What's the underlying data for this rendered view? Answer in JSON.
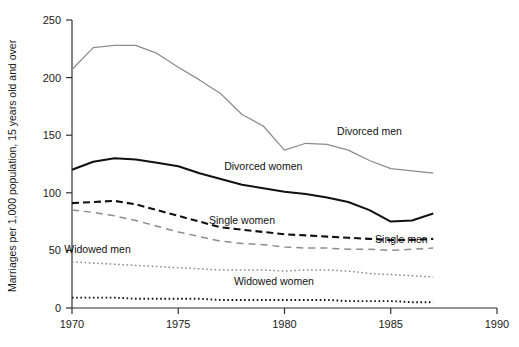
{
  "chart_data": {
    "type": "line",
    "title": "",
    "xlabel": "",
    "ylabel": "Marriages per 1,000 population, 15 years old and over",
    "xlim": [
      1970,
      1990
    ],
    "ylim": [
      0,
      250
    ],
    "xticks": [
      "1970",
      "1975",
      "1980",
      "1985",
      "1990"
    ],
    "yticks": [
      "0",
      "50",
      "100",
      "150",
      "200",
      "250"
    ],
    "grid": false,
    "legend_position": "inline-annotations",
    "x": [
      1970,
      1971,
      1972,
      1973,
      1974,
      1975,
      1976,
      1977,
      1978,
      1979,
      1980,
      1981,
      1982,
      1983,
      1984,
      1985,
      1986,
      1987
    ],
    "series": [
      {
        "name": "Divorced men",
        "color": "#8c8c8c",
        "style": "solid",
        "label_x": 1984,
        "label_y": 150,
        "values": [
          207,
          226,
          228,
          228,
          221,
          209,
          198,
          186,
          168,
          158,
          137,
          143,
          142,
          137,
          128,
          121,
          119,
          117
        ]
      },
      {
        "name": "Divorced women",
        "color": "#111111",
        "style": "solid",
        "label_x": 1979,
        "label_y": 120,
        "values": [
          120,
          127,
          130,
          129,
          126,
          123,
          117,
          112,
          107,
          104,
          101,
          99,
          96,
          92,
          85,
          75,
          76,
          82
        ]
      },
      {
        "name": "Single women",
        "color": "#111111",
        "style": "dashed",
        "label_x": 1978,
        "label_y": 73,
        "values": [
          91,
          92,
          93,
          90,
          85,
          80,
          75,
          70,
          68,
          66,
          64,
          63,
          62,
          61,
          60,
          59,
          59,
          60
        ]
      },
      {
        "name": "Single men",
        "color": "#8c8c8c",
        "style": "dashed",
        "label_x": 1985.5,
        "label_y": 56,
        "values": [
          85,
          83,
          80,
          76,
          71,
          66,
          62,
          58,
          56,
          55,
          53,
          52,
          52,
          51,
          51,
          50,
          51,
          52
        ]
      },
      {
        "name": "Widowed men",
        "color": "#8c8c8c",
        "style": "dotted",
        "label_x": 1971.2,
        "label_y": 48,
        "values": [
          40,
          39,
          38,
          37,
          36,
          35,
          34,
          33,
          33,
          33,
          32,
          33,
          33,
          32,
          30,
          29,
          28,
          27
        ]
      },
      {
        "name": "Widowed women",
        "color": "#111111",
        "style": "dotted",
        "label_x": 1979.5,
        "label_y": 20,
        "values": [
          9,
          9,
          9,
          8,
          8,
          8,
          8,
          7,
          7,
          7,
          7,
          7,
          7,
          6,
          6,
          6,
          5,
          5
        ]
      }
    ]
  },
  "axes": {
    "y_axis_title": "Marriages per 1,000 population, 15 years old and over"
  }
}
